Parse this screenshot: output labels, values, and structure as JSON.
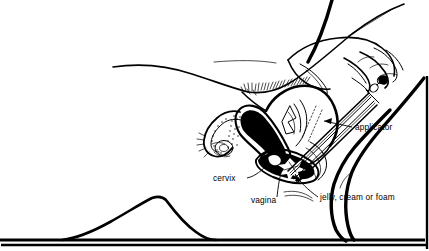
{
  "figure": {
    "style": "black-and-white line drawing, cross-sectional anatomical view",
    "colors": {
      "ink": "#000000",
      "background": "#ffffff"
    },
    "frame": {
      "visible_edges": "right and bottom rule lines",
      "line_color": "#000000"
    }
  },
  "labels": [
    {
      "id": "applicator",
      "text": "applicator",
      "x": 355,
      "y": 130,
      "anchor": "start",
      "leader_from": [
        352,
        127
      ],
      "leader_to": [
        322,
        121
      ],
      "arrow": "left"
    },
    {
      "id": "cervix",
      "text": "cervix",
      "x": 213,
      "y": 181,
      "anchor": "start",
      "leader_from": [
        247,
        178
      ],
      "leader_to": [
        268,
        166
      ],
      "arrow": "none"
    },
    {
      "id": "vagina",
      "text": "vagina",
      "x": 251,
      "y": 203,
      "anchor": "start",
      "leader_from": [
        277,
        196
      ],
      "leader_to": [
        281,
        172
      ],
      "arrow": "none"
    },
    {
      "id": "jelly-cream-or-foam",
      "text": "jelly, cream or foam",
      "x": 320,
      "y": 200,
      "anchor": "start",
      "leader_from": [
        318,
        197
      ],
      "leader_to": [
        296,
        172
      ],
      "arrow": "left"
    }
  ],
  "anatomy_parts": [
    {
      "id": "abdomen-contour",
      "name": "abdomen and torso outline"
    },
    {
      "id": "pubic-hair",
      "name": "pubic hair hatching"
    },
    {
      "id": "uterus",
      "name": "uterus with black endometrial cavity"
    },
    {
      "id": "fallopian-tube",
      "name": "fallopian tube with fimbriae"
    },
    {
      "id": "ovary",
      "name": "ovary"
    },
    {
      "id": "cervix-structure",
      "name": "cervix"
    },
    {
      "id": "vaginal-canal",
      "name": "vaginal canal filled black"
    },
    {
      "id": "spermicide-deposit",
      "name": "jelly, cream or foam deposit"
    },
    {
      "id": "bladder-rectum",
      "name": "adjacent pelvic structures"
    },
    {
      "id": "thigh-near",
      "name": "near thigh outline"
    },
    {
      "id": "thigh-far",
      "name": "far thigh outline"
    },
    {
      "id": "breast-contour",
      "name": "reclining body breast contour"
    },
    {
      "id": "bed-line",
      "name": "bed surface baseline"
    },
    {
      "id": "hand",
      "name": "hand gripping applicator plunger"
    },
    {
      "id": "forearm",
      "name": "forearm"
    },
    {
      "id": "applicator-tube",
      "name": "applicator barrel and plunger"
    }
  ]
}
